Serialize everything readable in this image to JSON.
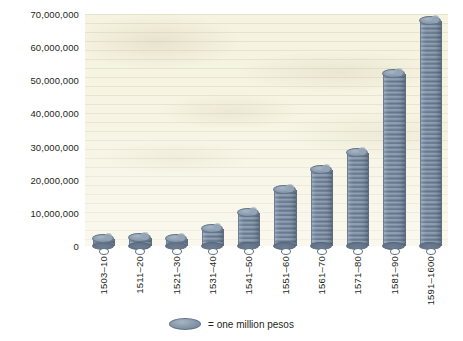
{
  "chart_data": {
    "type": "bar",
    "title": "",
    "subtitle": "",
    "xlabel": "",
    "ylabel": "",
    "categories": [
      "1503–10",
      "1511–20",
      "1521–30",
      "1531–40",
      "1541–50",
      "1551–60",
      "1561–70",
      "1571–80",
      "1581–90",
      "1591–1600"
    ],
    "values": [
      2000000,
      2500000,
      2000000,
      5000000,
      10000000,
      17000000,
      23000000,
      28000000,
      52000000,
      68000000
    ],
    "ylim": [
      0,
      70000000
    ],
    "y_ticks": [
      0,
      10000000,
      20000000,
      30000000,
      40000000,
      50000000,
      60000000,
      70000000
    ],
    "y_tick_labels": [
      "0",
      "10,000,000",
      "20,000,000",
      "30,000,000",
      "40,000,000",
      "50,000,000",
      "60,000,000",
      "70,000,000"
    ],
    "grid": false,
    "legend_position": "bottom",
    "legend": [
      {
        "symbol": "coin-disc",
        "label": "= one million pesos"
      }
    ],
    "unit_note": "each disc in a stack represents one million pesos",
    "bar_style": "pictorial stacked coins",
    "bar_color": "#7f90a4",
    "bar_top_color": "#9aaabb",
    "plot_background": "#f6f3e0"
  },
  "legend": {
    "swatch_name": "coin-disc",
    "text": "= one million pesos"
  },
  "colors": {
    "coin_face": "#7f90a4",
    "coin_top": "#9aaabb",
    "coin_edge": "#5f7087",
    "paper": "#f6f3e0",
    "text": "#231f20",
    "page": "#ffffff"
  }
}
